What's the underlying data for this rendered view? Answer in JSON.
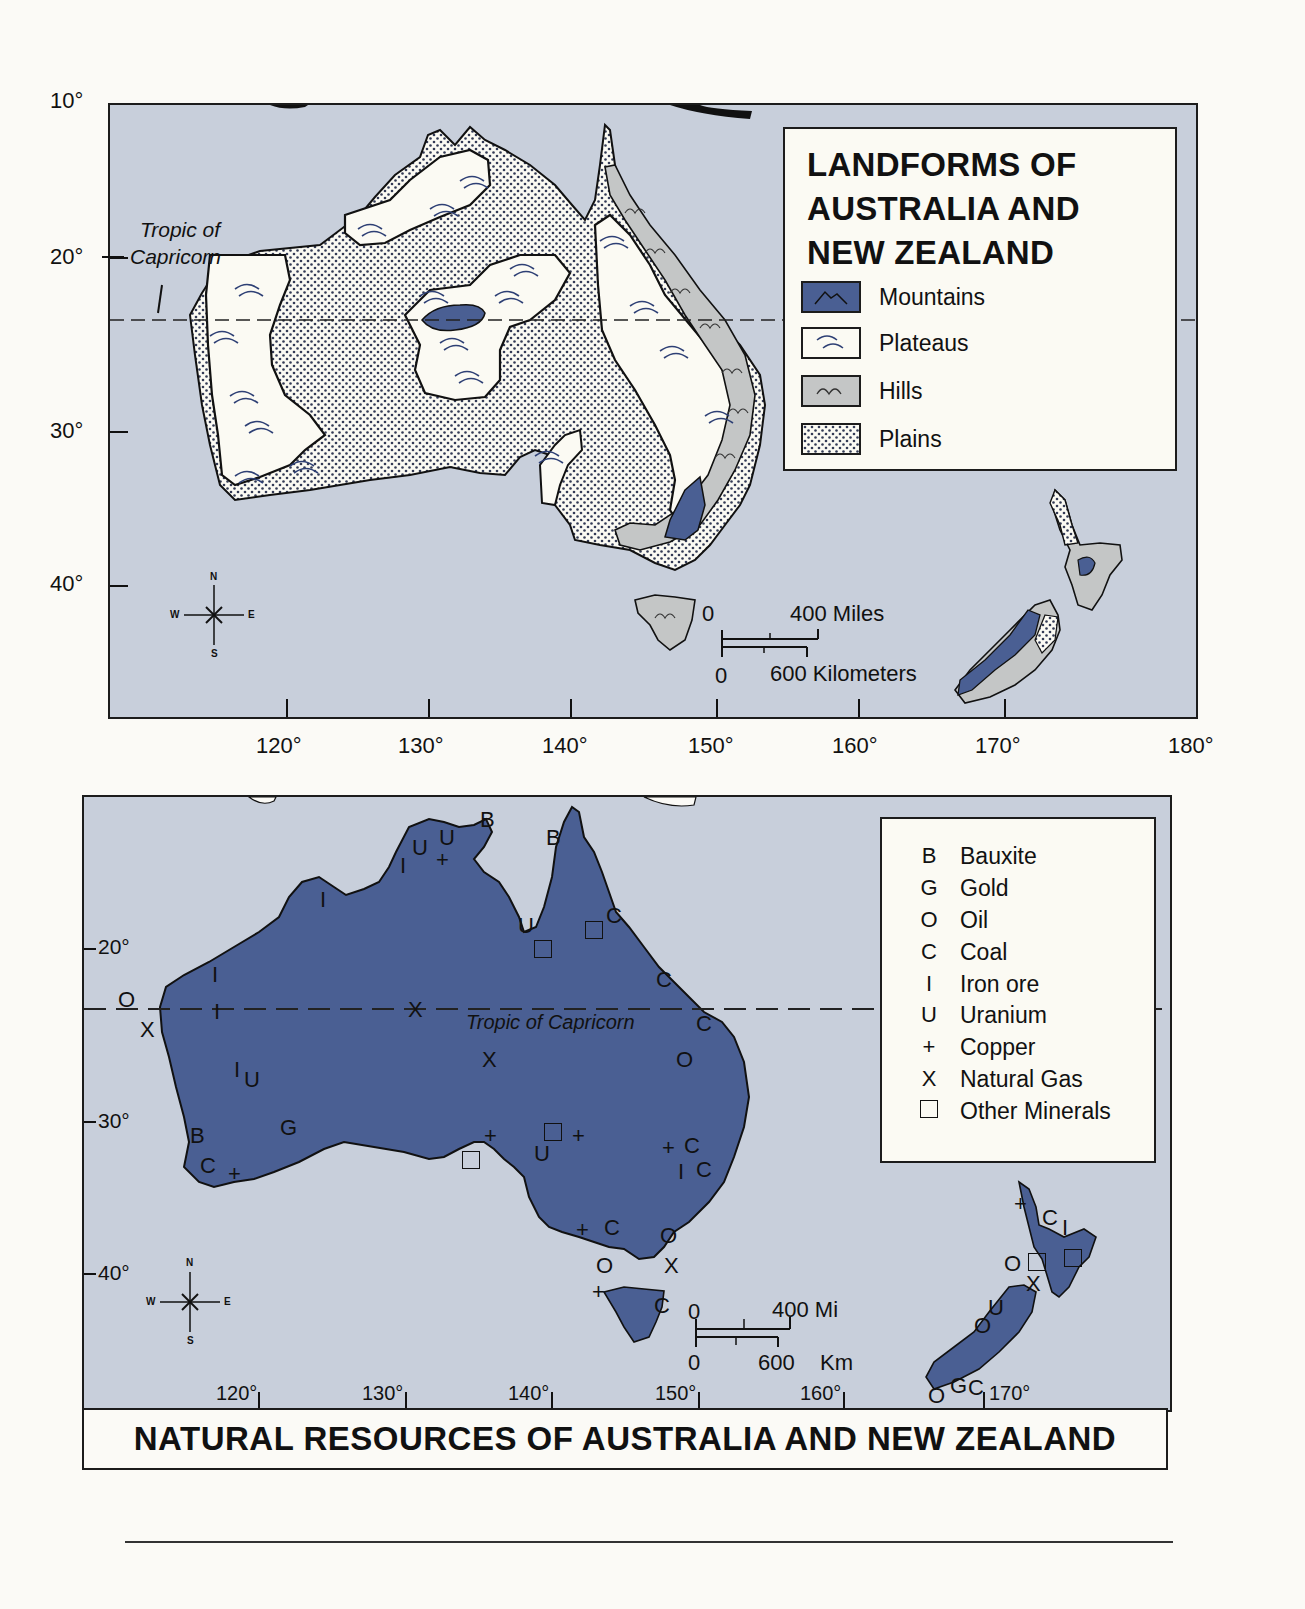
{
  "landforms_map": {
    "title": "LANDFORMS OF AUSTRALIA AND NEW ZEALAND",
    "title_lines": [
      "LANDFORMS OF",
      "AUSTRALIA AND",
      "NEW ZEALAND"
    ],
    "legend": [
      {
        "key": "mountains",
        "label": "Mountains",
        "color": "#4a5f93"
      },
      {
        "key": "plateaus",
        "label": "Plateaus",
        "color": "#fbfaf3"
      },
      {
        "key": "hills",
        "label": "Hills",
        "color": "#c4c6c6"
      },
      {
        "key": "plains",
        "label": "Plains",
        "color": "#fbfaf3"
      }
    ],
    "latitude_labels": [
      "10°",
      "20°",
      "30°",
      "40°"
    ],
    "longitude_labels": [
      "120°",
      "130°",
      "140°",
      "150°",
      "160°",
      "170°",
      "180°"
    ],
    "tropic_label_lines": [
      "Tropic of",
      "Capricorn"
    ],
    "scale": {
      "miles_zero": "0",
      "miles_label": "400 Miles",
      "km_zero": "0",
      "km_label": "600 Kilometers"
    },
    "compass": {
      "n": "N",
      "s": "S",
      "e": "E",
      "w": "W"
    }
  },
  "resources_map": {
    "title": "NATURAL RESOURCES OF AUSTRALIA AND NEW ZEALAND",
    "legend": [
      {
        "symbol": "B",
        "label": "Bauxite"
      },
      {
        "symbol": "G",
        "label": "Gold"
      },
      {
        "symbol": "O",
        "label": "Oil"
      },
      {
        "symbol": "C",
        "label": "Coal"
      },
      {
        "symbol": "I",
        "label": "Iron ore"
      },
      {
        "symbol": "U",
        "label": "Uranium"
      },
      {
        "symbol": "+",
        "label": "Copper"
      },
      {
        "symbol": "X",
        "label": "Natural Gas"
      },
      {
        "symbol": "□",
        "label": "Other Minerals"
      }
    ],
    "latitude_labels": [
      "20°",
      "30°",
      "40°"
    ],
    "longitude_labels": [
      "120°",
      "130°",
      "140°",
      "150°",
      "160°",
      "170°"
    ],
    "tropic_label": "Tropic of Capricorn",
    "scale": {
      "miles_zero": "0",
      "miles_label": "400 Mi",
      "km_zero": "0",
      "km_label": "600",
      "km_unit": "Km"
    },
    "compass": {
      "n": "N",
      "s": "S",
      "e": "E",
      "w": "W"
    },
    "land_color": "#4a5f93",
    "water_color": "#c8cfdb"
  }
}
